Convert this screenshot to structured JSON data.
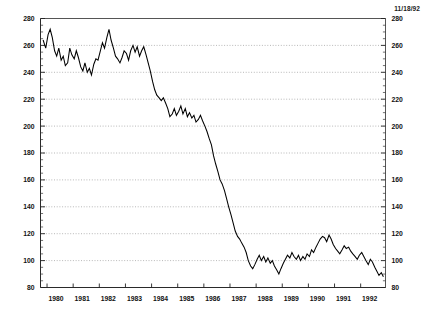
{
  "date_stamp": "11/18/92",
  "chart_data": {
    "type": "line",
    "title": "",
    "subtitle": "",
    "xlabel": "",
    "ylabel": "",
    "xlim": [
      1979.75,
      1992.95
    ],
    "ylim": [
      80,
      280
    ],
    "grid": true,
    "grid_axis": "y",
    "legend": false,
    "legend_position": "none",
    "annotations": [
      "11/18/92"
    ],
    "y_ticks": [
      80,
      100,
      120,
      140,
      160,
      180,
      200,
      220,
      240,
      260,
      280
    ],
    "y_tick_labels": [
      "80",
      "100",
      "120",
      "140",
      "160",
      "180",
      "200",
      "220",
      "240",
      "260",
      "280"
    ],
    "y_axis_right_ticks": [
      80,
      100,
      120,
      140,
      160,
      180,
      200,
      220,
      240,
      260,
      280
    ],
    "y_axis_right_tick_labels": [
      "80",
      "100",
      "120",
      "140",
      "160",
      "180",
      "200",
      "220",
      "240",
      "260",
      "280"
    ],
    "y_minor_tick_step": 5,
    "x_ticks": [
      1980,
      1981,
      1982,
      1983,
      1984,
      1985,
      1986,
      1987,
      1988,
      1989,
      1990,
      1991,
      1992
    ],
    "x_tick_labels": [
      "1980",
      "1981",
      "1982",
      "1983",
      "1984",
      "1985",
      "1986",
      "1987",
      "1988",
      "1989",
      "1990",
      "1991",
      "1992"
    ],
    "series": [
      {
        "name": "series-1",
        "color": "#000000",
        "x": [
          1979.85,
          1979.95,
          1980.04,
          1980.12,
          1980.2,
          1980.29,
          1980.37,
          1980.45,
          1980.54,
          1980.62,
          1980.7,
          1980.79,
          1980.87,
          1980.95,
          1981.04,
          1981.12,
          1981.2,
          1981.29,
          1981.37,
          1981.45,
          1981.54,
          1981.62,
          1981.7,
          1981.79,
          1981.87,
          1981.95,
          1982.04,
          1982.12,
          1982.2,
          1982.29,
          1982.37,
          1982.45,
          1982.54,
          1982.62,
          1982.7,
          1982.79,
          1982.87,
          1982.95,
          1983.04,
          1983.12,
          1983.2,
          1983.29,
          1983.37,
          1983.45,
          1983.54,
          1983.62,
          1983.7,
          1983.79,
          1983.87,
          1983.95,
          1984.04,
          1984.12,
          1984.2,
          1984.29,
          1984.37,
          1984.45,
          1984.54,
          1984.62,
          1984.7,
          1984.79,
          1984.87,
          1984.95,
          1985.04,
          1985.12,
          1985.2,
          1985.29,
          1985.37,
          1985.45,
          1985.54,
          1985.62,
          1985.7,
          1985.79,
          1985.87,
          1985.95,
          1986.04,
          1986.12,
          1986.2,
          1986.29,
          1986.37,
          1986.45,
          1986.54,
          1986.62,
          1986.7,
          1986.79,
          1986.87,
          1986.95,
          1987.04,
          1987.12,
          1987.2,
          1987.29,
          1987.37,
          1987.45,
          1987.54,
          1987.62,
          1987.7,
          1987.79,
          1987.87,
          1987.95,
          1988.04,
          1988.12,
          1988.2,
          1988.29,
          1988.37,
          1988.45,
          1988.54,
          1988.62,
          1988.7,
          1988.79,
          1988.87,
          1988.95,
          1989.04,
          1989.12,
          1989.2,
          1989.29,
          1989.37,
          1989.45,
          1989.54,
          1989.62,
          1989.7,
          1989.79,
          1989.87,
          1989.95,
          1990.04,
          1990.12,
          1990.2,
          1990.29,
          1990.37,
          1990.45,
          1990.54,
          1990.62,
          1990.7,
          1990.79,
          1990.87,
          1990.95,
          1991.04,
          1991.12,
          1991.2,
          1991.29,
          1991.37,
          1991.45,
          1991.54,
          1991.62,
          1991.7,
          1991.79,
          1991.87,
          1991.95,
          1992.04,
          1992.12,
          1992.2,
          1992.29,
          1992.37,
          1992.45,
          1992.54,
          1992.62,
          1992.7,
          1992.79,
          1992.87
        ],
        "values": [
          264,
          258,
          268,
          272,
          266,
          256,
          252,
          258,
          249,
          252,
          245,
          247,
          258,
          253,
          250,
          256,
          251,
          244,
          241,
          247,
          240,
          243,
          238,
          246,
          250,
          249,
          256,
          262,
          258,
          266,
          272,
          264,
          258,
          252,
          250,
          247,
          251,
          256,
          254,
          249,
          256,
          260,
          255,
          259,
          252,
          256,
          259,
          253,
          247,
          241,
          233,
          227,
          223,
          221,
          219,
          221,
          217,
          213,
          207,
          209,
          213,
          208,
          211,
          215,
          209,
          213,
          207,
          210,
          206,
          208,
          203,
          205,
          208,
          204,
          200,
          196,
          191,
          186,
          178,
          172,
          166,
          160,
          157,
          152,
          146,
          140,
          134,
          128,
          122,
          118,
          116,
          113,
          110,
          106,
          100,
          96,
          94,
          97,
          101,
          104,
          100,
          103,
          99,
          102,
          98,
          100,
          96,
          93,
          90,
          94,
          98,
          101,
          104,
          102,
          106,
          103,
          101,
          104,
          100,
          103,
          101,
          105,
          103,
          108,
          106,
          110,
          113,
          116,
          118,
          117,
          114,
          119,
          116,
          112,
          109,
          107,
          105,
          108,
          111,
          109,
          110,
          107,
          105,
          103,
          101,
          104,
          106,
          103,
          100,
          97,
          101,
          99,
          95,
          92,
          89,
          91,
          88
        ]
      }
    ]
  }
}
